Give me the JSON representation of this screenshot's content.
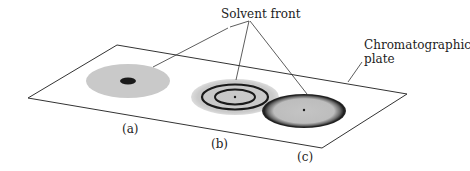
{
  "diagram": {
    "callouts": {
      "solvent_front": "Solvent front",
      "plate_line1": "Chromatographic",
      "plate_line2": "plate"
    },
    "spots": [
      {
        "label": "(a)",
        "description": "diffuse spot with dark central concentration"
      },
      {
        "label": "(b)",
        "description": "spot with concentric dark rings"
      },
      {
        "label": "(c)",
        "description": "spot with dark outer rim"
      }
    ],
    "colors": {
      "line": "#333333",
      "spot_fill": "#c8c8c8",
      "spot_dark": "#1a1a1a"
    }
  }
}
